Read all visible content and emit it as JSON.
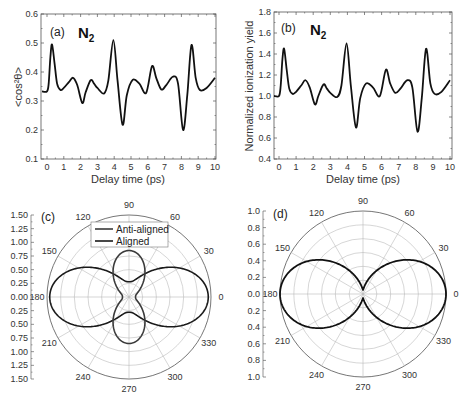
{
  "chart_data": [
    {
      "id": "a",
      "type": "line",
      "panel_label": "(a)",
      "molecule": "N",
      "molecule_subscript": "2",
      "xlabel": "Delay time (ps)",
      "ylabel": "<cos²θ>",
      "xlim": [
        -0.3,
        10
      ],
      "ylim": [
        0.1,
        0.6
      ],
      "xticks": [
        "0",
        "1",
        "2",
        "3",
        "4",
        "5",
        "6",
        "7",
        "8",
        "9",
        "10"
      ],
      "yticks": [
        "0.1",
        "0.2",
        "0.3",
        "0.4",
        "0.5",
        "0.6"
      ],
      "grid": false,
      "series": [
        {
          "name": "alignment",
          "color": "#111111",
          "x": [
            -0.3,
            0.0,
            0.1,
            0.2,
            0.3,
            0.45,
            0.6,
            0.8,
            1.0,
            1.3,
            1.55,
            1.8,
            2.1,
            2.3,
            2.6,
            2.8,
            3.0,
            3.4,
            3.65,
            3.95,
            4.2,
            4.5,
            4.75,
            5.1,
            5.5,
            5.9,
            6.25,
            6.5,
            6.8,
            7.1,
            7.5,
            7.8,
            8.1,
            8.35,
            8.6,
            8.85,
            9.1,
            9.5,
            10.0
          ],
          "values": [
            0.333,
            0.333,
            0.36,
            0.45,
            0.495,
            0.43,
            0.36,
            0.338,
            0.345,
            0.365,
            0.38,
            0.355,
            0.293,
            0.33,
            0.372,
            0.36,
            0.345,
            0.326,
            0.37,
            0.51,
            0.37,
            0.218,
            0.32,
            0.373,
            0.36,
            0.328,
            0.42,
            0.38,
            0.34,
            0.355,
            0.384,
            0.36,
            0.2,
            0.32,
            0.493,
            0.38,
            0.338,
            0.345,
            0.38
          ]
        }
      ]
    },
    {
      "id": "b",
      "type": "line",
      "panel_label": "(b)",
      "molecule": "N",
      "molecule_subscript": "2",
      "xlabel": "Delay time (ps)",
      "ylabel": "Normalized ionization yield",
      "xlim": [
        -0.3,
        10
      ],
      "ylim": [
        0.4,
        1.8
      ],
      "xticks": [
        "0",
        "1",
        "2",
        "3",
        "4",
        "5",
        "6",
        "7",
        "8",
        "9",
        "10"
      ],
      "yticks": [
        "0.4",
        "0.6",
        "0.8",
        "1.0",
        "1.2",
        "1.4",
        "1.6",
        "1.8"
      ],
      "grid": false,
      "series": [
        {
          "name": "ionization yield",
          "color": "#111111",
          "x": [
            -0.3,
            0.0,
            0.1,
            0.2,
            0.3,
            0.45,
            0.6,
            0.8,
            1.0,
            1.3,
            1.55,
            1.8,
            2.1,
            2.3,
            2.6,
            2.8,
            3.0,
            3.4,
            3.65,
            3.95,
            4.2,
            4.5,
            4.75,
            5.1,
            5.5,
            5.9,
            6.25,
            6.5,
            6.8,
            7.1,
            7.5,
            7.8,
            8.1,
            8.35,
            8.6,
            8.85,
            9.1,
            9.5,
            10.0
          ],
          "values": [
            1.0,
            1.0,
            1.1,
            1.35,
            1.45,
            1.25,
            1.07,
            1.02,
            1.04,
            1.1,
            1.15,
            1.08,
            0.92,
            1.0,
            1.11,
            1.07,
            1.03,
            0.99,
            1.1,
            1.5,
            1.1,
            0.7,
            0.98,
            1.12,
            1.08,
            1.0,
            1.25,
            1.12,
            1.03,
            1.07,
            1.15,
            1.08,
            0.66,
            0.98,
            1.45,
            1.12,
            1.02,
            1.04,
            1.15
          ]
        }
      ]
    },
    {
      "id": "c",
      "type": "polar",
      "panel_label": "(c)",
      "radial_ticks": [
        "1.50",
        "1.25",
        "1.00",
        "0.75",
        "0.50",
        "0.25",
        "0.00",
        "0.25",
        "0.50",
        "0.75",
        "1.00",
        "1.25",
        "1.50"
      ],
      "rlim": [
        0,
        1.5
      ],
      "angle_ticks": [
        "0",
        "30",
        "60",
        "90",
        "120",
        "150",
        "180",
        "210",
        "240",
        "270",
        "300",
        "330"
      ],
      "legend": [
        "Anti-aligned",
        "Aligned"
      ],
      "series": [
        {
          "name": "Anti-aligned",
          "color": "#3a3a3a",
          "shape": "peanut along 90-270 axis",
          "r_at_90": 0.85,
          "r_at_0": 0.12
        },
        {
          "name": "Aligned",
          "color": "#1a1a1a",
          "shape": "peanut along 0-180 axis",
          "r_at_0": 1.45,
          "r_at_90": 0.28
        }
      ]
    },
    {
      "id": "d",
      "type": "polar",
      "panel_label": "(d)",
      "radial_ticks": [
        "1.0",
        "0.8",
        "0.6",
        "0.4",
        "0.2",
        "0.0",
        "0.2",
        "0.4",
        "0.6",
        "0.8",
        "1.0"
      ],
      "rlim": [
        0,
        1.0
      ],
      "angle_ticks": [
        "0",
        "30",
        "60",
        "90",
        "120",
        "150",
        "180",
        "210",
        "240",
        "270",
        "300",
        "330"
      ],
      "series": [
        {
          "name": "ionization angular distribution",
          "color": "#111111",
          "shape": "figure-eight along 0-180 axis",
          "r_at_0": 1.0,
          "r_at_90": 0.05
        }
      ]
    }
  ],
  "panels": {
    "a": {
      "label": "(a)",
      "mol": "N",
      "sub": "2",
      "xlabel": "Delay time (ps)",
      "ylabel": "<cos²θ>"
    },
    "b": {
      "label": "(b)",
      "mol": "N",
      "sub": "2",
      "xlabel": "Delay time (ps)",
      "ylabel": "Normalized ionization yield"
    },
    "c": {
      "label": "(c)",
      "legend_anti": "Anti-aligned",
      "legend_aligned": "Aligned"
    },
    "d": {
      "label": "(d)"
    }
  }
}
